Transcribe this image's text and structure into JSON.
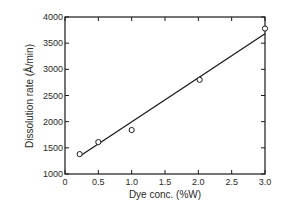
{
  "chart_data": {
    "type": "scatter",
    "title": "",
    "xlabel": "Dye conc. (%W)",
    "ylabel": "Dissolution rate (Å/min)",
    "xlim": [
      0,
      3.0
    ],
    "ylim": [
      1000,
      4000
    ],
    "x_ticks": [
      "0",
      "0.5",
      "1.0",
      "1.5",
      "2.0",
      "2.5",
      "3.0"
    ],
    "y_ticks": [
      "1000",
      "1500",
      "2000",
      "2500",
      "3000",
      "3500",
      "4000"
    ],
    "grid": false,
    "legend": null,
    "series": [
      {
        "name": "measured",
        "marker": "open-circle",
        "x": [
          0.22,
          0.5,
          1.0,
          2.02,
          3.0
        ],
        "y": [
          1380,
          1610,
          1840,
          2800,
          3780
        ]
      },
      {
        "name": "fit-line",
        "style": "solid-line",
        "x": [
          0.22,
          3.0
        ],
        "y": [
          1340,
          3680
        ]
      }
    ]
  },
  "colors": {
    "ink": "#1a1a1a",
    "background": "#ffffff"
  },
  "labels": {
    "xlabel": "Dye conc. (%W)",
    "ylabel": "Dissolution rate (Å/min)"
  }
}
